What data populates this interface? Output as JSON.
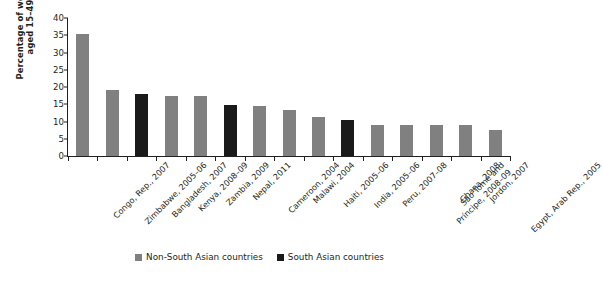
{
  "chart_data": {
    "type": "bar",
    "title": "",
    "xlabel": "",
    "ylabel": "Percentage of women aged 15–49",
    "ylabel_lines": [
      "Percentage of women",
      "aged 15–49"
    ],
    "ylim": [
      0,
      40
    ],
    "yticks": [
      0,
      5,
      10,
      15,
      20,
      25,
      30,
      35,
      40
    ],
    "grid": false,
    "legend_position": "bottom-center",
    "categories": [
      "Congo, Rep., 2007",
      "Zimbabwe, 2005–06",
      "Bangladesh, 2007",
      "Kenya, 2008–09",
      "Zambia, 2009",
      "Nepal, 2011",
      "Cameroon, 2004",
      "Malawi, 2004",
      "Haiti, 2005–06",
      "India, 2005–06",
      "Peru, 2007–08",
      "São Tomé and Príncipe, 2008–09",
      "Ghana, 2008",
      "Jordon, 2007",
      "Egypt, Arab Rep., 2005"
    ],
    "values": [
      35.3,
      19.2,
      18.1,
      17.5,
      17.4,
      14.7,
      14.6,
      13.2,
      11.4,
      10.5,
      9.1,
      9.0,
      9.0,
      8.9,
      7.5
    ],
    "groups": [
      "Non-South Asian countries",
      "Non-South Asian countries",
      "South Asian countries",
      "Non-South Asian countries",
      "Non-South Asian countries",
      "South Asian countries",
      "Non-South Asian countries",
      "Non-South Asian countries",
      "Non-South Asian countries",
      "South Asian countries",
      "Non-South Asian countries",
      "Non-South Asian countries",
      "Non-South Asian countries",
      "Non-South Asian countries",
      "Non-South Asian countries"
    ],
    "legend": [
      {
        "label": "Non-South Asian countries",
        "color": "#808080"
      },
      {
        "label": "South Asian countries",
        "color": "#1a1a1a"
      }
    ],
    "colors": {
      "non_south_asian": "#808080",
      "south_asian": "#1a1a1a",
      "axis": "#231f20"
    }
  }
}
